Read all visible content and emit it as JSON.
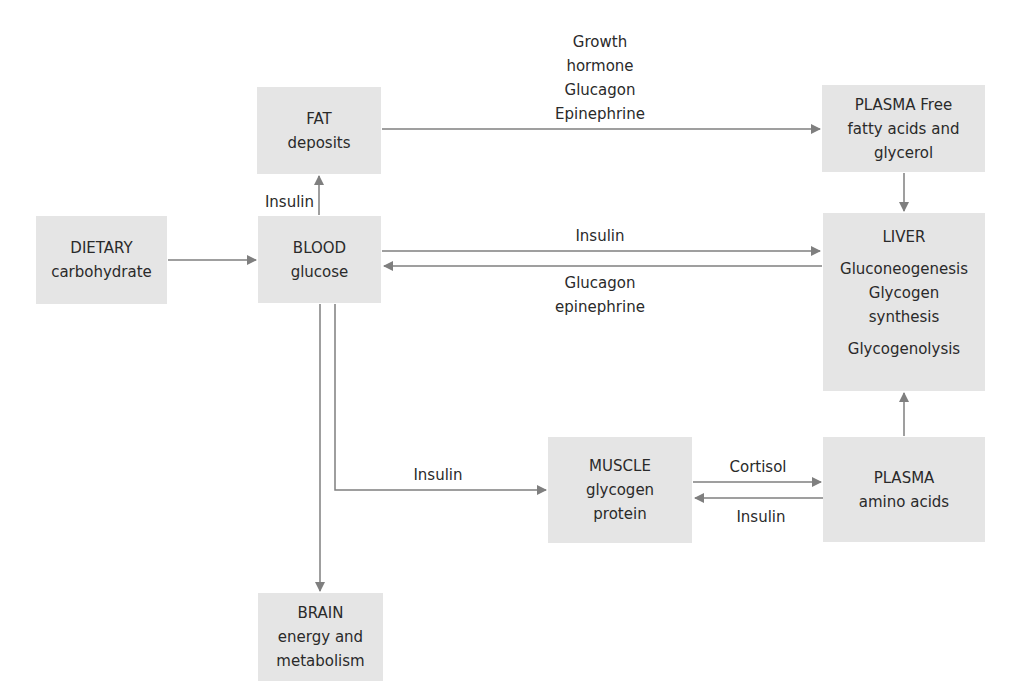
{
  "diagram": {
    "colors": {
      "box_fill": "#e5e5e5",
      "arrow": "#7f7f7f",
      "text": "#2a2a2a"
    },
    "nodes": {
      "fat": {
        "title": "FAT",
        "sub": "deposits"
      },
      "dietary": {
        "title": "DIETARY",
        "sub": "carbohydrate"
      },
      "blood": {
        "title": "BLOOD",
        "sub": "glucose"
      },
      "plasma_ffa": {
        "title": "PLASMA Free",
        "sub1": "fatty acids and",
        "sub2": "glycerol"
      },
      "liver": {
        "title": "LIVER",
        "line1": "Gluconeogenesis",
        "line2": "Glycogen",
        "line3": "synthesis",
        "line4": "Glycogenolysis"
      },
      "muscle": {
        "title": "MUSCLE",
        "sub1": "glycogen",
        "sub2": "protein"
      },
      "plasma_aa": {
        "title": "PLASMA",
        "sub": "amino acids"
      },
      "brain": {
        "title": "BRAIN",
        "sub1": "energy and",
        "sub2": "metabolism"
      }
    },
    "edges": [
      {
        "from": "dietary",
        "to": "blood",
        "label": ""
      },
      {
        "from": "blood",
        "to": "fat",
        "label": "Insulin"
      },
      {
        "from": "fat",
        "to": "plasma_ffa",
        "label_lines": [
          "Growth",
          "hormone",
          "Glucagon",
          "Epinephrine"
        ]
      },
      {
        "from": "plasma_ffa",
        "to": "liver",
        "label": ""
      },
      {
        "from": "blood",
        "to": "liver",
        "label": "Insulin"
      },
      {
        "from": "liver",
        "to": "blood",
        "label_lines": [
          "Glucagon",
          "epinephrine"
        ]
      },
      {
        "from": "blood",
        "to": "muscle",
        "label": "Insulin"
      },
      {
        "from": "muscle",
        "to": "plasma_aa",
        "label": "Cortisol"
      },
      {
        "from": "plasma_aa",
        "to": "muscle",
        "label": "Insulin"
      },
      {
        "from": "plasma_aa",
        "to": "liver",
        "label": ""
      },
      {
        "from": "blood",
        "to": "brain",
        "label": ""
      }
    ]
  }
}
